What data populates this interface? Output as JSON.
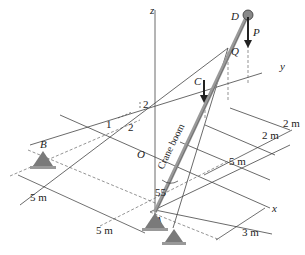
{
  "diagram": {
    "axes": {
      "x": "x",
      "y": "y",
      "z": "z"
    },
    "points": {
      "O": "O",
      "A": "A",
      "B": "B",
      "C": "C",
      "D": "D",
      "Q": "Q"
    },
    "load": "P",
    "boom_label": "Crane boom",
    "angle_label": "55",
    "slope": {
      "rise_left": "1",
      "run": "2",
      "rise_right": "2"
    },
    "dimensions": {
      "d_top_1": "2 m",
      "d_top_2": "2 m",
      "d_mid": "5 m",
      "d_bottom_right": "3 m",
      "d_left_1": "5 m",
      "d_left_2": "5 m"
    },
    "colors": {
      "line": "#333333",
      "support": "#7a7a7a",
      "boom": "#9a9a9a",
      "arrow": "#222222"
    }
  }
}
